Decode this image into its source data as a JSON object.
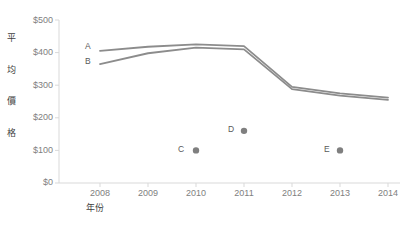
{
  "chart_data": {
    "type": "line",
    "title": "",
    "xlabel": "年份",
    "ylabel": "平均價格",
    "xlim": [
      2008,
      2014
    ],
    "ylim": [
      0,
      500
    ],
    "grid": false,
    "legend_position": "inline-left",
    "x": [
      2008,
      2009,
      2010,
      2011,
      2012,
      2013,
      2014
    ],
    "xtick_labels": [
      "2008",
      "2009",
      "2010",
      "2011",
      "2012",
      "2013",
      "2014"
    ],
    "ytick_labels": [
      "$0",
      "$100",
      "$200",
      "$300",
      "$400",
      "$500"
    ],
    "ytick_values": [
      0,
      100,
      200,
      300,
      400,
      500
    ],
    "series": [
      {
        "name": "A",
        "label": "A",
        "color": "#8c8c8c",
        "values": [
          405,
          418,
          425,
          420,
          295,
          275,
          262
        ]
      },
      {
        "name": "B",
        "label": "B",
        "color": "#8c8c8c",
        "values": [
          365,
          398,
          415,
          410,
          288,
          268,
          255
        ]
      }
    ],
    "points": [
      {
        "label": "C",
        "x": 2010,
        "y": 100,
        "color": "#7f7f7f"
      },
      {
        "label": "D",
        "x": 2011,
        "y": 160,
        "color": "#7f7f7f"
      },
      {
        "label": "E",
        "x": 2013,
        "y": 100,
        "color": "#7f7f7f"
      }
    ],
    "axis_color": "#d9d9d9"
  },
  "axis": {
    "y_title_chars": [
      "平",
      "均",
      "價",
      "格"
    ],
    "x_title": "年份"
  }
}
